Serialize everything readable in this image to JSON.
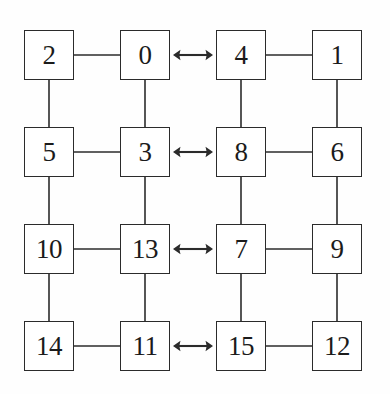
{
  "diagram": {
    "type": "node-link-diagram",
    "canvas": {
      "width": 390,
      "height": 394,
      "background": "#fefefe"
    },
    "style": {
      "box_border_color": "#2b2b2b",
      "box_fill_color": "#ffffff",
      "edge_color": "#2b2b2b",
      "label_color": "#1b1b1b",
      "arrow_glyph": "double-headed-arrow"
    },
    "grid": {
      "rows": 4,
      "columns": 4,
      "clusters": 2,
      "cluster_names": [
        "left-cluster",
        "right-cluster"
      ]
    },
    "nodes": [
      {
        "id": "n2",
        "label": "2",
        "row": 1,
        "col": 1,
        "x": 24,
        "y": 30,
        "w": 50,
        "h": 50
      },
      {
        "id": "n0",
        "label": "0",
        "row": 1,
        "col": 2,
        "x": 120,
        "y": 30,
        "w": 50,
        "h": 50
      },
      {
        "id": "n4",
        "label": "4",
        "row": 1,
        "col": 3,
        "x": 216,
        "y": 30,
        "w": 50,
        "h": 50
      },
      {
        "id": "n1",
        "label": "1",
        "row": 1,
        "col": 4,
        "x": 312,
        "y": 30,
        "w": 50,
        "h": 50
      },
      {
        "id": "n5",
        "label": "5",
        "row": 2,
        "col": 1,
        "x": 24,
        "y": 127,
        "w": 50,
        "h": 50
      },
      {
        "id": "n3",
        "label": "3",
        "row": 2,
        "col": 2,
        "x": 120,
        "y": 127,
        "w": 50,
        "h": 50
      },
      {
        "id": "n8",
        "label": "8",
        "row": 2,
        "col": 3,
        "x": 216,
        "y": 127,
        "w": 50,
        "h": 50
      },
      {
        "id": "n6",
        "label": "6",
        "row": 2,
        "col": 4,
        "x": 312,
        "y": 127,
        "w": 50,
        "h": 50
      },
      {
        "id": "n10",
        "label": "10",
        "row": 3,
        "col": 1,
        "x": 24,
        "y": 224,
        "w": 50,
        "h": 50
      },
      {
        "id": "n13",
        "label": "13",
        "row": 3,
        "col": 2,
        "x": 120,
        "y": 224,
        "w": 50,
        "h": 50
      },
      {
        "id": "n7",
        "label": "7",
        "row": 3,
        "col": 3,
        "x": 216,
        "y": 224,
        "w": 50,
        "h": 50
      },
      {
        "id": "n9",
        "label": "9",
        "row": 3,
        "col": 4,
        "x": 312,
        "y": 224,
        "w": 50,
        "h": 50
      },
      {
        "id": "n14",
        "label": "14",
        "row": 4,
        "col": 1,
        "x": 24,
        "y": 321,
        "w": 50,
        "h": 50
      },
      {
        "id": "n11",
        "label": "11",
        "row": 4,
        "col": 2,
        "x": 120,
        "y": 321,
        "w": 50,
        "h": 50
      },
      {
        "id": "n15",
        "label": "15",
        "row": 4,
        "col": 3,
        "x": 216,
        "y": 321,
        "w": 50,
        "h": 50
      },
      {
        "id": "n12",
        "label": "12",
        "row": 4,
        "col": 4,
        "x": 312,
        "y": 321,
        "w": 50,
        "h": 50
      }
    ],
    "edges": [
      {
        "from": "2",
        "to": "0",
        "kind": "horizontal-line",
        "x1": 74,
        "y1": 55,
        "x2": 120,
        "y2": 55
      },
      {
        "from": "4",
        "to": "1",
        "kind": "horizontal-line",
        "x1": 266,
        "y1": 55,
        "x2": 312,
        "y2": 55
      },
      {
        "from": "5",
        "to": "3",
        "kind": "horizontal-line",
        "x1": 74,
        "y1": 152,
        "x2": 120,
        "y2": 152
      },
      {
        "from": "8",
        "to": "6",
        "kind": "horizontal-line",
        "x1": 266,
        "y1": 152,
        "x2": 312,
        "y2": 152
      },
      {
        "from": "10",
        "to": "13",
        "kind": "horizontal-line",
        "x1": 74,
        "y1": 249,
        "x2": 120,
        "y2": 249
      },
      {
        "from": "7",
        "to": "9",
        "kind": "horizontal-line",
        "x1": 266,
        "y1": 249,
        "x2": 312,
        "y2": 249
      },
      {
        "from": "14",
        "to": "11",
        "kind": "horizontal-line",
        "x1": 74,
        "y1": 346,
        "x2": 120,
        "y2": 346
      },
      {
        "from": "15",
        "to": "12",
        "kind": "horizontal-line",
        "x1": 266,
        "y1": 346,
        "x2": 312,
        "y2": 346
      },
      {
        "from": "2",
        "to": "5",
        "kind": "vertical-line",
        "x1": 49,
        "y1": 80,
        "x2": 49,
        "y2": 127
      },
      {
        "from": "0",
        "to": "3",
        "kind": "vertical-line",
        "x1": 145,
        "y1": 80,
        "x2": 145,
        "y2": 127
      },
      {
        "from": "4",
        "to": "8",
        "kind": "vertical-line",
        "x1": 241,
        "y1": 80,
        "x2": 241,
        "y2": 127
      },
      {
        "from": "1",
        "to": "6",
        "kind": "vertical-line",
        "x1": 337,
        "y1": 80,
        "x2": 337,
        "y2": 127
      },
      {
        "from": "5",
        "to": "10",
        "kind": "vertical-line",
        "x1": 49,
        "y1": 177,
        "x2": 49,
        "y2": 224
      },
      {
        "from": "3",
        "to": "13",
        "kind": "vertical-line",
        "x1": 145,
        "y1": 177,
        "x2": 145,
        "y2": 224
      },
      {
        "from": "8",
        "to": "7",
        "kind": "vertical-line",
        "x1": 241,
        "y1": 177,
        "x2": 241,
        "y2": 224
      },
      {
        "from": "6",
        "to": "9",
        "kind": "vertical-line",
        "x1": 337,
        "y1": 177,
        "x2": 337,
        "y2": 224
      },
      {
        "from": "10",
        "to": "14",
        "kind": "vertical-line",
        "x1": 49,
        "y1": 274,
        "x2": 49,
        "y2": 321
      },
      {
        "from": "13",
        "to": "11",
        "kind": "vertical-line",
        "x1": 145,
        "y1": 274,
        "x2": 145,
        "y2": 321
      },
      {
        "from": "7",
        "to": "15",
        "kind": "vertical-line",
        "x1": 241,
        "y1": 274,
        "x2": 241,
        "y2": 321
      },
      {
        "from": "9",
        "to": "12",
        "kind": "vertical-line",
        "x1": 337,
        "y1": 274,
        "x2": 337,
        "y2": 321
      }
    ],
    "bidirectional_arrows": [
      {
        "id": "arrow-row-1",
        "from": "0",
        "to": "4",
        "glyph": "double-headed-arrow",
        "x": 173,
        "y": 45,
        "w": 40,
        "h": 20,
        "row": 1
      },
      {
        "id": "arrow-row-2",
        "from": "3",
        "to": "8",
        "glyph": "double-headed-arrow",
        "x": 173,
        "y": 142,
        "w": 40,
        "h": 20,
        "row": 2
      },
      {
        "id": "arrow-row-3",
        "from": "13",
        "to": "7",
        "glyph": "double-headed-arrow",
        "x": 173,
        "y": 239,
        "w": 40,
        "h": 20,
        "row": 3
      },
      {
        "id": "arrow-row-4",
        "from": "11",
        "to": "15",
        "glyph": "double-headed-arrow",
        "x": 173,
        "y": 336,
        "w": 40,
        "h": 20,
        "row": 4
      }
    ]
  }
}
